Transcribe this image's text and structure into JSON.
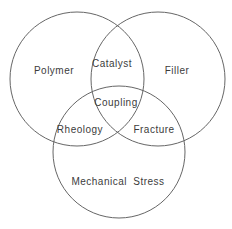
{
  "diagram": {
    "type": "venn",
    "background_color": "#ffffff",
    "stroke_color": "#666666",
    "text_color": "#3c3c3c",
    "circles": [
      {
        "id": "polymer",
        "label": "Polymer",
        "cx": 77,
        "cy": 79,
        "r": 67
      },
      {
        "id": "filler",
        "label": "Filler",
        "cx": 158,
        "cy": 79,
        "r": 67
      },
      {
        "id": "mechanical-stress",
        "label": "Mechanical Stress",
        "cx": 119,
        "cy": 152,
        "r": 66
      }
    ],
    "intersections": [
      {
        "id": "catalyst",
        "label": "Catalyst",
        "between": [
          "Polymer",
          "Filler"
        ]
      },
      {
        "id": "coupling",
        "label": "Coupling",
        "between": [
          "Polymer",
          "Filler",
          "Mechanical Stress"
        ]
      },
      {
        "id": "rheology",
        "label": "Rheology",
        "between": [
          "Polymer",
          "Mechanical Stress"
        ]
      },
      {
        "id": "fracture",
        "label": "Fracture",
        "between": [
          "Filler",
          "Mechanical Stress"
        ]
      }
    ]
  }
}
